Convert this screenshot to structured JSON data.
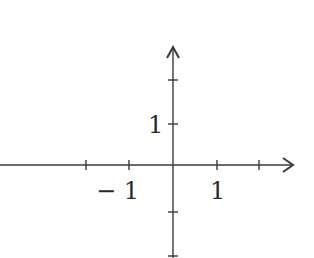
{
  "diagram": {
    "type": "coordinate-axes",
    "colors": {
      "axis": "#3a3a3a",
      "text": "#2a2a2a",
      "background": "#ffffff"
    },
    "origin_px": {
      "x": 173,
      "y": 165
    },
    "unit_px": 44,
    "x_axis": {
      "arrow": "right",
      "ticks": [
        -2,
        -1,
        1,
        2
      ],
      "labels": [
        {
          "value": -1,
          "text": "− 1"
        },
        {
          "value": 1,
          "text": "1"
        }
      ]
    },
    "y_axis": {
      "arrow": "up",
      "ticks": [
        2,
        1,
        -1,
        -2
      ],
      "labels": [
        {
          "value": 1,
          "text": "1"
        }
      ]
    }
  }
}
